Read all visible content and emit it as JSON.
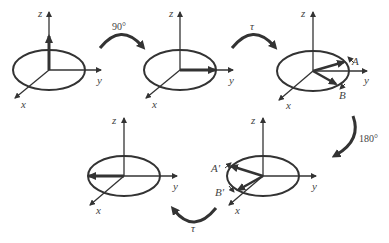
{
  "diagram": {
    "colors": {
      "stroke": "#333333",
      "background": "#ffffff",
      "label": "#444444"
    },
    "panels": [
      {
        "id": "p1",
        "axes": {
          "x": "x",
          "y": "y",
          "z": "z"
        },
        "vector": "along +z"
      },
      {
        "id": "p2",
        "axes": {
          "x": "x",
          "y": "y",
          "z": "z"
        },
        "vector": "along +y"
      },
      {
        "id": "p3",
        "axes": {
          "x": "x",
          "y": "y",
          "z": "z"
        },
        "vectors": [
          "A",
          "B"
        ],
        "labels": {
          "a": "A",
          "b": "B"
        }
      },
      {
        "id": "p4",
        "axes": {
          "x": "x",
          "y": "y",
          "z": "z"
        },
        "vectors": [
          "A'",
          "B'"
        ],
        "labels": {
          "a": "A'",
          "b": "B'"
        }
      },
      {
        "id": "p5",
        "axes": {
          "x": "x",
          "y": "y",
          "z": "z"
        },
        "vector": "along -y"
      }
    ],
    "transitions": [
      {
        "from": "p1",
        "to": "p2",
        "label": "90°"
      },
      {
        "from": "p2",
        "to": "p3",
        "label": "τ"
      },
      {
        "from": "p3",
        "to": "p4",
        "label": "180°"
      },
      {
        "from": "p4",
        "to": "p5",
        "label": "τ"
      }
    ]
  }
}
